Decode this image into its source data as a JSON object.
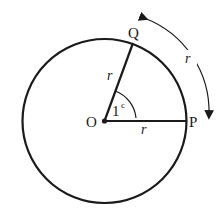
{
  "diagram": {
    "labels": {
      "center": "O",
      "point_q": "Q",
      "point_p": "P",
      "radius_oq": "r",
      "radius_op": "r",
      "arc_length": "r",
      "angle": "1",
      "angle_unit": "c"
    },
    "colors": {
      "stroke": "#1a1a1a",
      "background": "#ffffff"
    }
  }
}
